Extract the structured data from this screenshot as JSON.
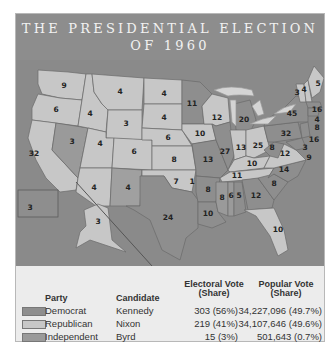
{
  "title": {
    "line1": "THE PRESIDENTIAL ELECTION",
    "line2": "OF 1960"
  },
  "colors": {
    "democrat": "#8e8e8e",
    "republican": "#c7c7c7",
    "independent": "#9a9a9a",
    "water": "#8a8a8a",
    "lakes": "#d4d4d4"
  },
  "map": {
    "states": [
      {
        "name": "WA",
        "ev": "9",
        "party": "republican"
      },
      {
        "name": "OR",
        "ev": "6",
        "party": "republican"
      },
      {
        "name": "CA",
        "ev": "32",
        "party": "republican"
      },
      {
        "name": "NV",
        "ev": "3",
        "party": "democrat"
      },
      {
        "name": "ID",
        "ev": "4",
        "party": "republican"
      },
      {
        "name": "MT",
        "ev": "4",
        "party": "republican"
      },
      {
        "name": "WY",
        "ev": "3",
        "party": "republican"
      },
      {
        "name": "UT",
        "ev": "4",
        "party": "republican"
      },
      {
        "name": "CO",
        "ev": "6",
        "party": "republican"
      },
      {
        "name": "AZ",
        "ev": "4",
        "party": "republican"
      },
      {
        "name": "NM",
        "ev": "4",
        "party": "democrat"
      },
      {
        "name": "ND",
        "ev": "4",
        "party": "republican"
      },
      {
        "name": "SD",
        "ev": "4",
        "party": "republican"
      },
      {
        "name": "NE",
        "ev": "6",
        "party": "republican"
      },
      {
        "name": "KS",
        "ev": "8",
        "party": "republican"
      },
      {
        "name": "OK",
        "ev": "7",
        "party": "republican"
      },
      {
        "name": "OK-Byrd",
        "ev": "1",
        "party": "independent"
      },
      {
        "name": "TX",
        "ev": "24",
        "party": "democrat"
      },
      {
        "name": "MN",
        "ev": "11",
        "party": "democrat"
      },
      {
        "name": "IA",
        "ev": "10",
        "party": "republican"
      },
      {
        "name": "MO",
        "ev": "13",
        "party": "democrat"
      },
      {
        "name": "AR",
        "ev": "8",
        "party": "democrat"
      },
      {
        "name": "LA",
        "ev": "10",
        "party": "democrat"
      },
      {
        "name": "WI",
        "ev": "12",
        "party": "republican"
      },
      {
        "name": "IL",
        "ev": "27",
        "party": "democrat"
      },
      {
        "name": "MI",
        "ev": "20",
        "party": "democrat"
      },
      {
        "name": "IN",
        "ev": "13",
        "party": "republican"
      },
      {
        "name": "OH",
        "ev": "25",
        "party": "republican"
      },
      {
        "name": "KY",
        "ev": "10",
        "party": "republican"
      },
      {
        "name": "TN",
        "ev": "11",
        "party": "republican"
      },
      {
        "name": "MS",
        "ev": "8",
        "party": "independent"
      },
      {
        "name": "AL",
        "ev": "6",
        "party": "independent"
      },
      {
        "name": "AL-D",
        "ev": "5",
        "party": "democrat"
      },
      {
        "name": "GA",
        "ev": "12",
        "party": "democrat"
      },
      {
        "name": "FL",
        "ev": "10",
        "party": "republican"
      },
      {
        "name": "SC",
        "ev": "8",
        "party": "democrat"
      },
      {
        "name": "NC",
        "ev": "14",
        "party": "democrat"
      },
      {
        "name": "VA",
        "ev": "12",
        "party": "republican"
      },
      {
        "name": "WV",
        "ev": "8",
        "party": "democrat"
      },
      {
        "name": "PA",
        "ev": "32",
        "party": "democrat"
      },
      {
        "name": "NY",
        "ev": "45",
        "party": "democrat"
      },
      {
        "name": "VT",
        "ev": "3",
        "party": "republican"
      },
      {
        "name": "NH",
        "ev": "4",
        "party": "republican"
      },
      {
        "name": "ME",
        "ev": "5",
        "party": "republican"
      },
      {
        "name": "MA",
        "ev": "16",
        "party": "democrat"
      },
      {
        "name": "RI",
        "ev": "4",
        "party": "democrat"
      },
      {
        "name": "CT",
        "ev": "8",
        "party": "democrat"
      },
      {
        "name": "NJ",
        "ev": "16",
        "party": "democrat"
      },
      {
        "name": "DE",
        "ev": "3",
        "party": "democrat"
      },
      {
        "name": "MD",
        "ev": "9",
        "party": "democrat"
      },
      {
        "name": "HI",
        "ev": "3",
        "party": "democrat"
      },
      {
        "name": "AK",
        "ev": "3",
        "party": "republican"
      }
    ]
  },
  "legend": {
    "headers": {
      "party": "Party",
      "candidate": "Candidate",
      "electoral_line1": "Electoral Vote",
      "electoral_line2": "(Share)",
      "popular_line1": "Popular Vote",
      "popular_line2": "(Share)"
    },
    "rows": [
      {
        "party": "Democrat",
        "candidate": "Kennedy",
        "electoral": "303 (56%)",
        "popular": "34,227,096 (49.7%)"
      },
      {
        "party": "Republican",
        "candidate": "Nixon",
        "electoral": "219 (41%)",
        "popular": "34,107,646 (49.6%)"
      },
      {
        "party": "Independent",
        "candidate": "Byrd",
        "electoral": "15 (3%)",
        "popular": "501,643 (0.7%)"
      }
    ]
  }
}
